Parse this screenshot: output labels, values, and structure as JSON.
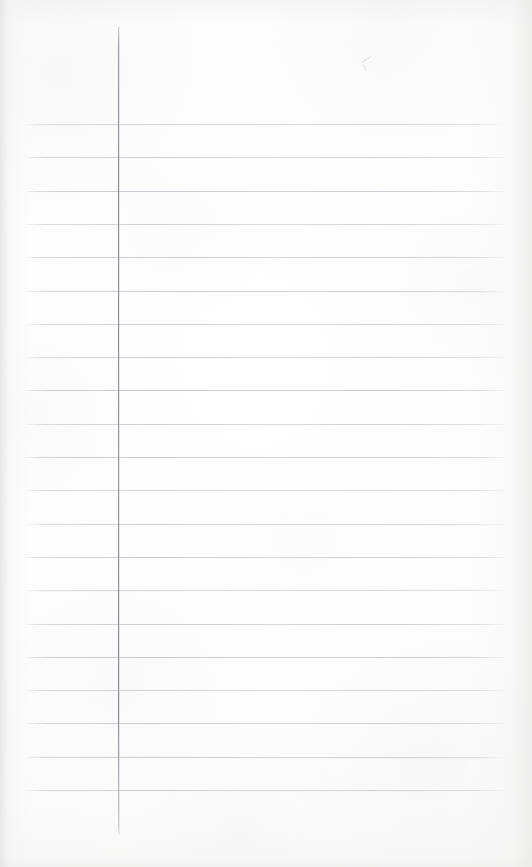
{
  "document": {
    "kind": "ruled-notebook-paper",
    "title": "Blank ruled notepad sheet",
    "description": "A blank, unwritten sheet of lined notepad paper photographed against a white surface.",
    "page_width": 532,
    "page_height": 867,
    "content_text": ""
  },
  "paper": {
    "background_color": "#fdfdfd",
    "edge_shadow_color": "#e4e4e4",
    "texture": "subtle paper fibre mottling"
  },
  "ruling": {
    "horizontal_rule_color": "#c6c9cf",
    "horizontal_rule_count": 21,
    "horizontal_rule_thickness_px": 1,
    "rule_start_x": 26,
    "rule_end_x": 505,
    "first_rule_y": 124,
    "rule_spacing_px": 33.3,
    "rule_y_positions": [
      124,
      157.3,
      190.6,
      223.9,
      257.2,
      290.5,
      323.8,
      357.1,
      390.4,
      423.7,
      457.0,
      490.3,
      523.6,
      556.9,
      590.2,
      623.5,
      656.8,
      690.1,
      723.4,
      756.7,
      790.0
    ]
  },
  "margin_rule": {
    "color": "#8a8b92",
    "orientation": "vertical",
    "x": 118,
    "top_y": 27,
    "bottom_y": 835,
    "thickness_px": 1
  },
  "marks": [
    {
      "name": "stray-pencil-mark",
      "x": 362,
      "y": 57,
      "color": "#c9c9cc",
      "note": "faint stray pencil stroke near top of sheet"
    }
  ]
}
